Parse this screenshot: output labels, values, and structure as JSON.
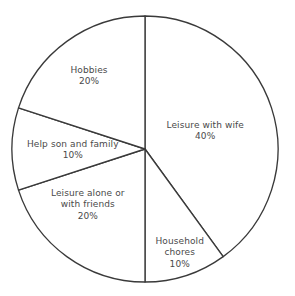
{
  "chart_data": {
    "type": "pie",
    "title": "",
    "subtitle": "",
    "xlabel": "",
    "ylabel": "",
    "legend": "none",
    "grid": false,
    "units": "percent",
    "start_angle_deg": 0,
    "direction": "clockwise",
    "categories": [
      "Leisure with wife",
      "Household chores",
      "Leisure alone or with friends",
      "Help son and family",
      "Hobbies"
    ],
    "values": [
      40,
      10,
      20,
      10,
      20
    ],
    "slices": [
      {
        "label": "Leisure with wife",
        "label_lines": "Leisure with wife",
        "value": 40,
        "percent_text": "40%",
        "start_deg": 0,
        "end_deg": 144,
        "fill": "#ffffff",
        "stroke": "#3a3a3a"
      },
      {
        "label": "Household chores",
        "label_lines": "Household\nchores",
        "value": 10,
        "percent_text": "10%",
        "start_deg": 144,
        "end_deg": 180,
        "fill": "#ffffff",
        "stroke": "#3a3a3a"
      },
      {
        "label": "Leisure alone or with friends",
        "label_lines": "Leisure alone or\nwith friends",
        "value": 20,
        "percent_text": "20%",
        "start_deg": 180,
        "end_deg": 252,
        "fill": "#ffffff",
        "stroke": "#3a3a3a"
      },
      {
        "label": "Help son and family",
        "label_lines": "Help son and family",
        "value": 10,
        "percent_text": "10%",
        "start_deg": 252,
        "end_deg": 288,
        "fill": "#ffffff",
        "stroke": "#3a3a3a"
      },
      {
        "label": "Hobbies",
        "label_lines": "Hobbies",
        "value": 20,
        "percent_text": "20%",
        "start_deg": 288,
        "end_deg": 360,
        "fill": "#ffffff",
        "stroke": "#3a3a3a"
      }
    ],
    "total": 100,
    "geometry": {
      "center_x": 145,
      "center_y": 149,
      "radius": 133
    },
    "colors": {
      "background": "#ffffff",
      "slice_fill": "#ffffff",
      "outline": "#3a3a3a",
      "text": "#4a4a4a"
    }
  }
}
